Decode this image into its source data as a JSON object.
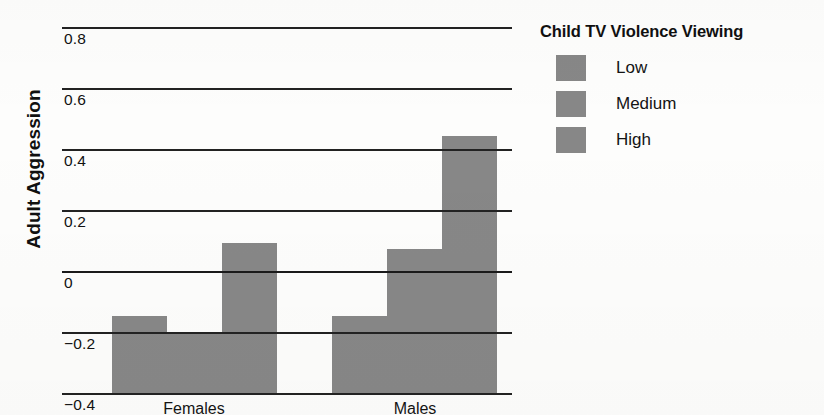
{
  "chart_data": {
    "type": "bar",
    "title": "",
    "xlabel": "",
    "ylabel": "Adult Aggression",
    "ylim": [
      -0.4,
      0.8
    ],
    "ytick_step": 0.2,
    "yticks": [
      0.8,
      0.6,
      0.4,
      0.2,
      0,
      -0.2,
      -0.4
    ],
    "ytick_labels": [
      "0.8",
      "0.6",
      "0.4",
      "0.2",
      "0",
      "−0.2",
      "−0.4"
    ],
    "categories": [
      "Females",
      "Males"
    ],
    "grid": true,
    "legend_position": "right",
    "legend_title": "Child TV Violence Viewing",
    "bar_color": "#878787",
    "baseline": -0.4,
    "series": [
      {
        "name": "Low",
        "color": "#878787",
        "values": [
          -0.14,
          -0.14
        ]
      },
      {
        "name": "Medium",
        "color": "#878787",
        "values": [
          -0.2,
          0.08
        ]
      },
      {
        "name": "High",
        "color": "#878787",
        "values": [
          0.1,
          0.45
        ]
      }
    ]
  },
  "axis": {
    "y_title": "Adult Aggression",
    "y_labels": {
      "t0": "0.8",
      "t1": "0.6",
      "t2": "0.4",
      "t3": "0.2",
      "t4": "0",
      "t5": "−0.2",
      "t6": "−0.4"
    },
    "x_labels": {
      "c0": "Females",
      "c1": "Males"
    }
  },
  "legend": {
    "title": "Child TV Violence Viewing",
    "items": [
      {
        "label": "Low",
        "color": "#878787"
      },
      {
        "label": "Medium",
        "color": "#878787"
      },
      {
        "label": "High",
        "color": "#878787"
      }
    ]
  }
}
